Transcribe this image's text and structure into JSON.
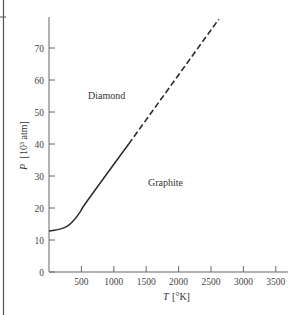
{
  "chart_data": {
    "type": "line",
    "title": "",
    "xlabel": "T [°K]",
    "ylabel": "P [10³ atm]",
    "xlim": [
      0,
      3600
    ],
    "ylim": [
      0,
      80
    ],
    "x_ticks": [
      500,
      1000,
      1500,
      2000,
      2500,
      3000,
      3500
    ],
    "y_ticks": [
      0,
      10,
      20,
      30,
      40,
      50,
      60,
      70
    ],
    "grid": false,
    "legend": null,
    "annotations": [
      {
        "text": "Diamond",
        "x": 900,
        "y": 55
      },
      {
        "text": "Graphite",
        "x": 1900,
        "y": 27
      }
    ],
    "series": [
      {
        "name": "phase boundary (measured)",
        "style": "solid",
        "x": [
          0,
          170,
          290,
          390,
          480,
          600,
          1230
        ],
        "y": [
          12.8,
          13.4,
          14.4,
          16.3,
          18.8,
          22.5,
          40
        ]
      },
      {
        "name": "phase boundary (extrapolated)",
        "style": "dashed",
        "x": [
          1230,
          2620
        ],
        "y": [
          40,
          79
        ]
      }
    ]
  },
  "labels": {
    "xlabel_T": "T",
    "xlabel_unit": "[°K]",
    "ylabel_P": "P",
    "ylabel_unit": "[10³ atm]",
    "diamond": "Diamond",
    "graphite": "Graphite"
  }
}
